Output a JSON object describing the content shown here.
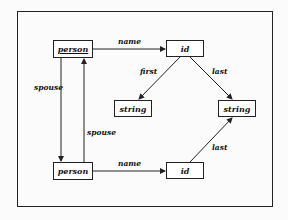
{
  "diagram": {
    "nodes": [
      {
        "id": "person_top",
        "label": "person",
        "underlined": true
      },
      {
        "id": "id_top",
        "label": "id"
      },
      {
        "id": "string_left",
        "label": "string"
      },
      {
        "id": "string_right",
        "label": "string"
      },
      {
        "id": "person_bottom",
        "label": "person"
      },
      {
        "id": "id_bottom",
        "label": "id"
      }
    ],
    "edges": [
      {
        "from": "person_top",
        "to": "id_top",
        "label": "name"
      },
      {
        "from": "id_top",
        "to": "string_left",
        "label": "first"
      },
      {
        "from": "id_top",
        "to": "string_right",
        "label": "last"
      },
      {
        "from": "person_top",
        "to": "person_bottom",
        "label": "spouse"
      },
      {
        "from": "person_bottom",
        "to": "person_top",
        "label": "spouse"
      },
      {
        "from": "person_bottom",
        "to": "id_bottom",
        "label": "name"
      },
      {
        "from": "id_bottom",
        "to": "string_right",
        "label": "last"
      }
    ]
  }
}
